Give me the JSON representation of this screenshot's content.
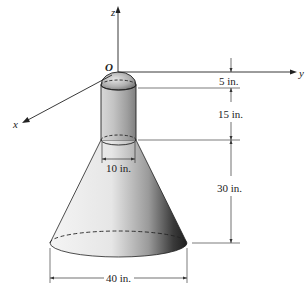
{
  "figure": {
    "axes": {
      "x_label": "x",
      "y_label": "y",
      "z_label": "z",
      "origin_label": "O"
    },
    "dimensions": {
      "cap_height": "5 in.",
      "cylinder_height": "15 in.",
      "cone_height": "30 in.",
      "cylinder_diameter": "10 in.",
      "cone_base_diameter": "40 in."
    },
    "colors": {
      "line": "#222222",
      "shade_light": "#f2f2f2",
      "shade_dark": "#2a2a2a"
    }
  }
}
